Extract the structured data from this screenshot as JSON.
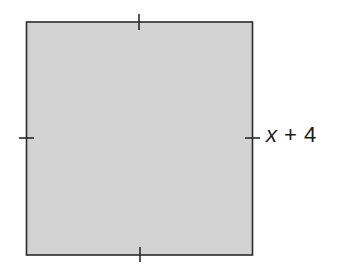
{
  "figure": {
    "shape": "square",
    "fill_color": "#d3d3d3",
    "stroke_color": "#2a2a2a",
    "side_label": {
      "variable": "x",
      "rest": " + 4",
      "full": "x + 4"
    },
    "tick_marks": 4
  }
}
